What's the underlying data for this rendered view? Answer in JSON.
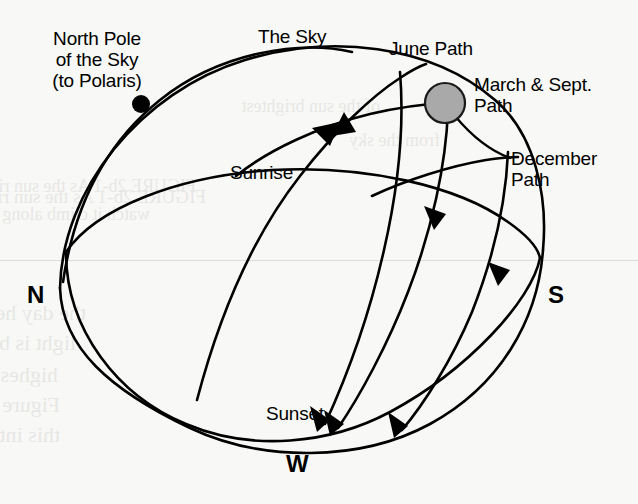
{
  "figure": {
    "background_color": "#f8f8f6",
    "ink_color": "#000000",
    "sun_color": "#a9a9a9",
    "pole_color": "#000000"
  },
  "labels": {
    "north_pole": "North Pole\nof the Sky\n(to Polaris)",
    "the_sky": "The Sky",
    "june_path": "June Path",
    "march_sept_path": "March & Sept.\nPath",
    "december_path": "December\nPath",
    "sunrise": "Sunrise",
    "sunset": "Sunset"
  },
  "compass": {
    "north": "N",
    "south": "S",
    "west": "W"
  },
  "markers": {
    "sun": {
      "name": "sun-disc",
      "cx": 445,
      "cy": 103,
      "r": 20
    },
    "celestial_pole": {
      "name": "north-celestial-pole-dot",
      "cx": 141,
      "cy": 104,
      "r": 9
    }
  },
  "ghost_text": [
    {
      "text": "FIGURE 2b-1 As the sun rises, we can",
      "x": 196,
      "y": 176,
      "size": 18
    },
    {
      "text": "watch it climb along the path toward",
      "x": 150,
      "y": 204,
      "size": 18
    },
    {
      "text": "FIGURE 2b-1 As the sun rises, we",
      "x": 206,
      "y": 186,
      "size": 19
    },
    {
      "text": "the day hemisphere, a daylight",
      "x": 86,
      "y": 300,
      "size": 22
    },
    {
      "text": "light is brightest and nearly",
      "x": 76,
      "y": 330,
      "size": 22
    },
    {
      "text": "highest in the sky and daylight is a",
      "x": 58,
      "y": 362,
      "size": 22
    },
    {
      "text": "Figure 2b-2 shows that Earth is actually",
      "x": 60,
      "y": 392,
      "size": 22
    },
    {
      "text": "this into a small circuit in Earth's orbit",
      "x": 60,
      "y": 422,
      "size": 22
    },
    {
      "text": "of the sun brightest",
      "x": 380,
      "y": 96,
      "size": 18
    },
    {
      "text": "from the sky",
      "x": 440,
      "y": 130,
      "size": 18
    }
  ]
}
